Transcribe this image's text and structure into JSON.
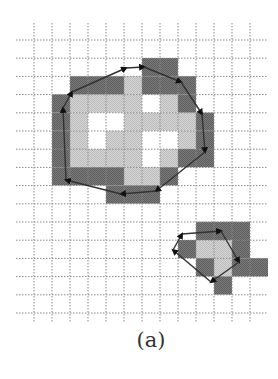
{
  "figure": {
    "caption": "(a)",
    "colors": {
      "background": "#ffffff",
      "grid_line": "#8a8a8a",
      "boundary_cell": "#707070",
      "interior_cell": "#cccccc",
      "contour": "#333333",
      "arrow": "#111111"
    },
    "grid": {
      "origin_x": 34,
      "origin_y": 40,
      "cell_w": 18,
      "cell_h": 18.2,
      "v_lines": 13,
      "h_lines": 16,
      "v_extent": [
        23,
        323
      ],
      "h_extent": [
        16,
        268
      ]
    },
    "regions": [
      {
        "name": "large-blob",
        "boundary_cells": [
          [
            5,
            1
          ],
          [
            6,
            1
          ],
          [
            1,
            2
          ],
          [
            2,
            2
          ],
          [
            3,
            2
          ],
          [
            5,
            2
          ],
          [
            6,
            2
          ],
          [
            7,
            2
          ],
          [
            0,
            3
          ],
          [
            7,
            3
          ],
          [
            0,
            4
          ],
          [
            8,
            4
          ],
          [
            0,
            5
          ],
          [
            8,
            5
          ],
          [
            0,
            6
          ],
          [
            7,
            6
          ],
          [
            8,
            6
          ],
          [
            0,
            7
          ],
          [
            1,
            7
          ],
          [
            2,
            7
          ],
          [
            3,
            7
          ],
          [
            6,
            7
          ],
          [
            3,
            8
          ],
          [
            4,
            8
          ],
          [
            5,
            8
          ]
        ],
        "interior_cells": [
          [
            4,
            2
          ],
          [
            1,
            3
          ],
          [
            2,
            3
          ],
          [
            3,
            3
          ],
          [
            4,
            3
          ],
          [
            6,
            3
          ],
          [
            1,
            4
          ],
          [
            4,
            4
          ],
          [
            5,
            4
          ],
          [
            6,
            4
          ],
          [
            7,
            4
          ],
          [
            1,
            5
          ],
          [
            3,
            5
          ],
          [
            4,
            5
          ],
          [
            7,
            5
          ],
          [
            1,
            6
          ],
          [
            2,
            6
          ],
          [
            3,
            6
          ],
          [
            4,
            6
          ],
          [
            6,
            6
          ],
          [
            4,
            7
          ],
          [
            5,
            7
          ]
        ],
        "contour": [
          [
            66,
            180
          ],
          [
            63,
            108
          ],
          [
            72,
            92
          ],
          [
            126,
            68
          ],
          [
            144,
            67
          ],
          [
            181,
            82
          ],
          [
            202,
            114
          ],
          [
            205,
            152
          ],
          [
            156,
            191
          ],
          [
            121,
            194
          ]
        ]
      },
      {
        "name": "small-blob",
        "boundary_cells": [
          [
            8,
            10
          ],
          [
            9,
            10
          ],
          [
            10,
            10
          ],
          [
            7,
            11
          ],
          [
            10,
            11
          ],
          [
            8,
            12
          ],
          [
            10,
            12
          ],
          [
            11,
            12
          ],
          [
            9,
            13
          ]
        ],
        "interior_cells": [
          [
            8,
            11
          ],
          [
            9,
            11
          ],
          [
            9,
            12
          ]
        ],
        "contour": [
          [
            182,
            234
          ],
          [
            221,
            231
          ],
          [
            239,
            262
          ],
          [
            211,
            282
          ],
          [
            173,
            250
          ]
        ]
      }
    ]
  }
}
